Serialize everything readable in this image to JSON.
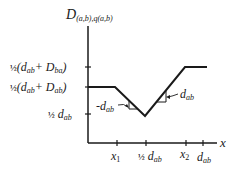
{
  "diagram": {
    "y_axis_label": {
      "main": "D",
      "sub": "(a,b),q(a,b)"
    },
    "x_axis_label": "x",
    "y_ticks": [
      {
        "frac": "½",
        "text": "(d",
        "sub1": "ab",
        "mid": "+ D",
        "sub2": "ba",
        "end": ")"
      },
      {
        "frac": "½",
        "text": "(d",
        "sub1": "ab",
        "mid": "+ D",
        "sub2": "ab",
        "end": ")"
      },
      {
        "frac": "½",
        "text": " d",
        "sub1": "ab"
      }
    ],
    "x_ticks": [
      {
        "main": "x",
        "sub": "1"
      },
      {
        "frac": "½",
        "main": " d",
        "sub": "ab"
      },
      {
        "main": "x",
        "sub": "2"
      },
      {
        "main": "d",
        "sub": "ab"
      }
    ],
    "slope_annotations": [
      {
        "prefix": "-d",
        "sub": "ab"
      },
      {
        "prefix": "d",
        "sub": "ab"
      }
    ],
    "colors": {
      "line": "#1a1a1a",
      "background": "#ffffff"
    }
  }
}
